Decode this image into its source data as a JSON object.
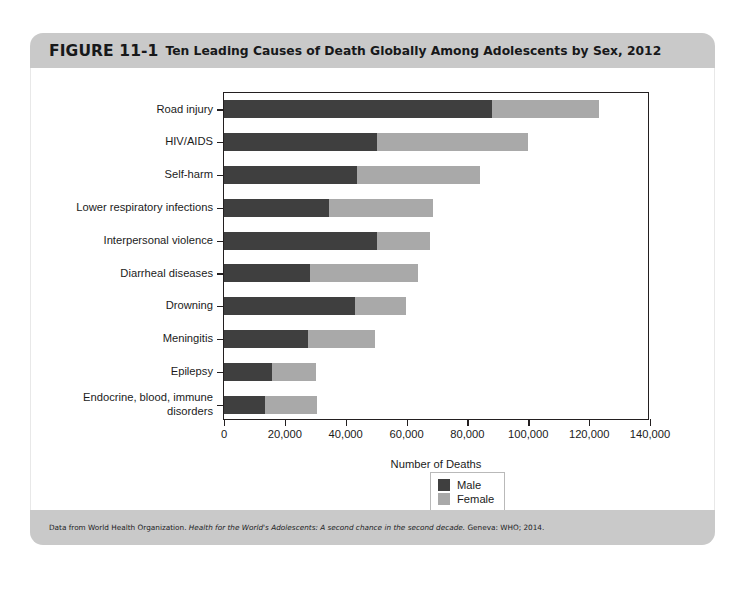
{
  "figure": {
    "number": "FIGURE 11-1",
    "title": "Ten Leading Causes of Death Globally Among Adolescents by Sex, 2012",
    "source_prefix": "Data from World Health Organization. ",
    "source_italic": "Health for the World's Adolescents: A second chance in the second decade.",
    "source_suffix": " Geneva: WHO; 2014."
  },
  "colors": {
    "male": "#3f3f3f",
    "female": "#a9a9a9",
    "band": "#c9c9c9",
    "axis": "#231f20",
    "plot_background": "#ffffff"
  },
  "legend": {
    "items": [
      {
        "label": "Male",
        "color": "#3f3f3f"
      },
      {
        "label": "Female",
        "color": "#a9a9a9"
      }
    ]
  },
  "chart_data": {
    "type": "bar",
    "orientation": "horizontal",
    "stacked": true,
    "title": "Ten Leading Causes of Death Globally Among Adolescents by Sex, 2012",
    "xlabel": "Number of Deaths",
    "ylabel": "",
    "xlim": [
      0,
      140000
    ],
    "xticks": [
      0,
      20000,
      40000,
      60000,
      80000,
      100000,
      120000,
      140000
    ],
    "xtick_labels": [
      "0",
      "20,000",
      "40,000",
      "60,000",
      "80,000",
      "100,000",
      "120,000",
      "140,000"
    ],
    "grid": false,
    "legend_position": "bottom-right",
    "categories": [
      "Road injury",
      "HIV/AIDS",
      "Self-harm",
      "Lower respiratory infections",
      "Interpersonal violence",
      "Diarrheal diseases",
      "Drowning",
      "Meningitis",
      "Epilepsy",
      "Endocrine, blood, immune\ndisorders"
    ],
    "series": [
      {
        "name": "Male",
        "color": "#3f3f3f",
        "values": [
          88000,
          50400,
          43800,
          34500,
          50400,
          28300,
          43200,
          27500,
          15800,
          13500
        ]
      },
      {
        "name": "Female",
        "color": "#a9a9a9",
        "values": [
          35300,
          49400,
          40300,
          34300,
          17200,
          35600,
          16500,
          22100,
          14600,
          16900
        ]
      }
    ],
    "totals": [
      123300,
      99800,
      84100,
      68800,
      67600,
      63900,
      59700,
      49600,
      30400,
      30400
    ]
  }
}
